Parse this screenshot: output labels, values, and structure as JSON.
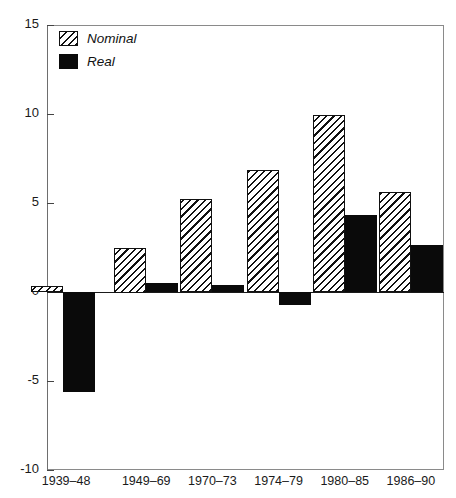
{
  "chart_data": {
    "type": "bar",
    "title": "",
    "xlabel": "",
    "ylabel": "",
    "ylim": [
      -10,
      15
    ],
    "yticks": [
      15,
      10,
      5,
      0,
      -5,
      -10
    ],
    "ytick_labels": [
      "15",
      "10",
      "5",
      "0",
      "-5",
      "-10"
    ],
    "grid": false,
    "legend_position": "top-left",
    "categories": [
      "1939–48",
      "1949–69",
      "1970–73",
      "1974–79",
      "1980–85",
      "1986–90"
    ],
    "series": [
      {
        "name": "Nominal",
        "fill": "hatched",
        "values": [
          0.35,
          2.5,
          5.25,
          6.85,
          9.95,
          5.6
        ]
      },
      {
        "name": "Real",
        "fill": "solid-black",
        "values": [
          -5.6,
          0.5,
          0.4,
          -0.75,
          4.3,
          2.65
        ]
      }
    ]
  },
  "legend": {
    "items": [
      {
        "label": "Nominal",
        "swatch": "hatched-swatch"
      },
      {
        "label": "Real",
        "swatch": "solid-black-swatch"
      }
    ]
  },
  "colors": {
    "ink": "#111111",
    "frame": "#8a8a8a",
    "background": "#ffffff",
    "real_fill": "#0a0a0a"
  }
}
